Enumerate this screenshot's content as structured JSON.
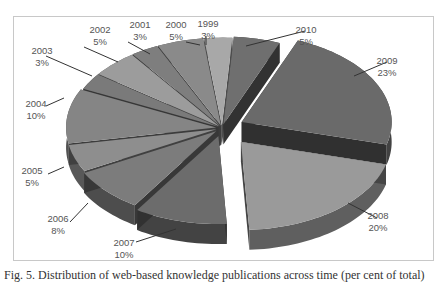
{
  "chart_data": {
    "type": "pie",
    "style": "3d-exploded",
    "title": "",
    "categories": [
      "1999",
      "2000",
      "2001",
      "2002",
      "2003",
      "2004",
      "2005",
      "2006",
      "2007",
      "2008",
      "2009",
      "2010"
    ],
    "values": [
      3,
      5,
      3,
      5,
      3,
      10,
      5,
      8,
      10,
      20,
      23,
      5
    ],
    "unit": "%",
    "labels": [
      {
        "year": "1999",
        "pct": "3%"
      },
      {
        "year": "2000",
        "pct": "5%"
      },
      {
        "year": "2001",
        "pct": "3%"
      },
      {
        "year": "2002",
        "pct": "5%"
      },
      {
        "year": "2003",
        "pct": "3%"
      },
      {
        "year": "2004",
        "pct": "10%"
      },
      {
        "year": "2005",
        "pct": "5%"
      },
      {
        "year": "2006",
        "pct": "8%"
      },
      {
        "year": "2007",
        "pct": "10%"
      },
      {
        "year": "2008",
        "pct": "20%"
      },
      {
        "year": "2009",
        "pct": "23%"
      },
      {
        "year": "2010",
        "pct": "5%"
      }
    ],
    "legend": "none",
    "grid": false
  },
  "caption": "Fig. 5. Distribution of web-based knowledge publications across time (per cent of total)"
}
